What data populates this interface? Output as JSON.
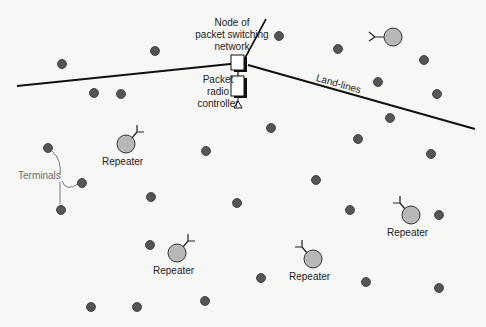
{
  "labels": {
    "node": [
      "Node of",
      "packet switching",
      "network"
    ],
    "controller": [
      "Packet",
      "radio",
      "controller"
    ],
    "landlines": "Land-lines",
    "terminals": "Terminals",
    "repeater": "Repeater"
  },
  "colors": {
    "background": "#f7f7f5",
    "terminal_dot": "#555555",
    "repeater_fill": "#b8b8b8",
    "line": "#111111",
    "terminal_label": "#6b6b6b"
  },
  "terminals": [
    [
      62,
      64
    ],
    [
      155,
      51
    ],
    [
      279,
      36
    ],
    [
      338,
      49
    ],
    [
      424,
      60
    ],
    [
      378,
      82
    ],
    [
      437,
      94
    ],
    [
      94,
      93
    ],
    [
      121,
      94
    ],
    [
      390,
      118
    ],
    [
      271,
      128
    ],
    [
      358,
      139
    ],
    [
      431,
      154
    ],
    [
      206,
      151
    ],
    [
      48,
      148
    ],
    [
      82,
      183
    ],
    [
      61,
      210
    ],
    [
      316,
      180
    ],
    [
      151,
      197
    ],
    [
      237,
      203
    ],
    [
      350,
      210
    ],
    [
      439,
      215
    ],
    [
      150,
      245
    ],
    [
      261,
      278
    ],
    [
      366,
      282
    ],
    [
      439,
      288
    ],
    [
      91,
      307
    ],
    [
      137,
      307
    ],
    [
      205,
      301
    ]
  ],
  "repeaters": [
    {
      "x": 393,
      "y": 37,
      "label": "",
      "antenna": "left"
    },
    {
      "x": 126,
      "y": 144,
      "label": "Repeater",
      "antenna": "upright"
    },
    {
      "x": 411,
      "y": 215,
      "label": "Repeater",
      "antenna": "upleft"
    },
    {
      "x": 177,
      "y": 253,
      "label": "Repeater",
      "antenna": "upright"
    },
    {
      "x": 313,
      "y": 259,
      "label": "Repeater",
      "antenna": "upleft"
    }
  ]
}
